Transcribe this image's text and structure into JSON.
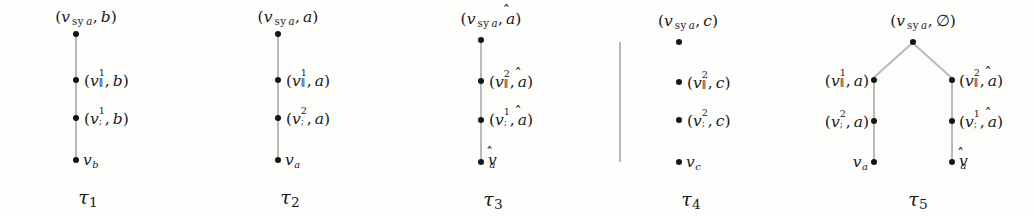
{
  "figure": {
    "type": "tree-diagram-set",
    "background": "#fdfdfc",
    "node_color": "#141414",
    "edge_color": "#b9b9b9",
    "symbols": {
      "v": "v",
      "sy_subscript": "sy",
      "sy_arg": "a",
      "parallel": "∥",
      "semicolon": ";",
      "hat": "̂",
      "emptyset": "∅",
      "tau": "τ",
      "open_paren": "(",
      "close_paren": ")",
      "comma": ","
    },
    "trees": [
      {
        "id": "tau-1",
        "caption": "τ",
        "caption_index": "1",
        "shape": "path",
        "nodes": [
          {
            "id": "t1-root",
            "label_side": "above",
            "v": "v",
            "sub": "sy a",
            "second": "b",
            "paren": true,
            "sup": "",
            "vsub": ""
          },
          {
            "id": "t1-n1",
            "label_side": "right",
            "v": "v",
            "sup": "1",
            "vsub": "∥",
            "second": "b",
            "paren": true
          },
          {
            "id": "t1-n2",
            "label_side": "right",
            "v": "v",
            "sup": "1",
            "vsub": ";",
            "second": "b",
            "paren": true
          },
          {
            "id": "t1-leaf",
            "label_side": "right",
            "v": "v",
            "vsub": "b",
            "leaf": true
          }
        ]
      },
      {
        "id": "tau-2",
        "caption": "τ",
        "caption_index": "2",
        "shape": "path",
        "nodes": [
          {
            "id": "t2-root",
            "label_side": "above",
            "v": "v",
            "sub": "sy a",
            "second": "a",
            "paren": true
          },
          {
            "id": "t2-n1",
            "label_side": "right",
            "v": "v",
            "sup": "1",
            "vsub": "∥",
            "second": "a",
            "paren": true
          },
          {
            "id": "t2-n2",
            "label_side": "right",
            "v": "v",
            "sup": "2",
            "vsub": ";",
            "second": "a",
            "paren": true
          },
          {
            "id": "t2-leaf",
            "label_side": "right",
            "v": "v",
            "vsub": "a",
            "leaf": true
          }
        ]
      },
      {
        "id": "tau-3",
        "caption": "τ",
        "caption_index": "3",
        "shape": "path",
        "nodes": [
          {
            "id": "t3-root",
            "label_side": "above",
            "v": "v",
            "sub": "sy a",
            "second": "â",
            "paren": true
          },
          {
            "id": "t3-n1",
            "label_side": "right",
            "v": "v",
            "sup": "2",
            "vsub": "∥",
            "second": "â",
            "paren": true
          },
          {
            "id": "t3-n2",
            "label_side": "right",
            "v": "v",
            "sup": "1",
            "vsub": ";",
            "second": "â",
            "paren": true
          },
          {
            "id": "t3-leaf",
            "label_side": "right",
            "v": "v̂",
            "vsub": "a",
            "leaf": true,
            "hatted": true
          }
        ]
      },
      {
        "id": "tau-4",
        "caption": "τ",
        "caption_index": "4",
        "shape": "path",
        "nodes": [
          {
            "id": "t4-root",
            "label_side": "above",
            "v": "v",
            "sub": "sy a",
            "second": "c",
            "paren": true
          },
          {
            "id": "t4-n1",
            "label_side": "right",
            "v": "v",
            "sup": "2",
            "vsub": "∥",
            "second": "c",
            "paren": true
          },
          {
            "id": "t4-n2",
            "label_side": "right",
            "v": "v",
            "sup": "2",
            "vsub": ";",
            "second": "c",
            "paren": true
          },
          {
            "id": "t4-leaf",
            "label_side": "right",
            "v": "v",
            "vsub": "c",
            "leaf": true
          }
        ]
      },
      {
        "id": "tau-5",
        "caption": "τ",
        "caption_index": "5",
        "shape": "branching",
        "nodes": [
          {
            "id": "t5-root",
            "label_side": "above",
            "v": "v",
            "sub": "sy a",
            "second": "∅",
            "paren": true
          },
          {
            "id": "t5-l1",
            "label_side": "left",
            "v": "v",
            "sup": "1",
            "vsub": "∥",
            "second": "a",
            "paren": true
          },
          {
            "id": "t5-l2",
            "label_side": "left",
            "v": "v",
            "sup": "2",
            "vsub": ";",
            "second": "a",
            "paren": true
          },
          {
            "id": "t5-lleaf",
            "label_side": "left",
            "v": "v",
            "vsub": "a",
            "leaf": true
          },
          {
            "id": "t5-r1",
            "label_side": "right",
            "v": "v",
            "sup": "2",
            "vsub": "∥",
            "second": "â",
            "paren": true
          },
          {
            "id": "t5-r2",
            "label_side": "right",
            "v": "v",
            "sup": "1",
            "vsub": ";",
            "second": "â",
            "paren": true
          },
          {
            "id": "t5-rleaf",
            "label_side": "right",
            "v": "v̂",
            "vsub": "a",
            "leaf": true,
            "hatted": true
          }
        ]
      }
    ],
    "labels": {
      "t1_root": "(v sy a, b)",
      "t1_n1": "(v∥¹, b)",
      "t1_n2": "(v;¹, b)",
      "t1_leaf": "v_b",
      "t2_root": "(v sy a, a)",
      "t2_n1": "(v∥¹, a)",
      "t2_n2": "(v;², a)",
      "t2_leaf": "v_a",
      "t3_root": "(v sy a, â)",
      "t3_n1": "(v∥², â)",
      "t3_n2": "(v;¹, â)",
      "t3_leaf": "v̂_a",
      "t4_root": "(v sy a, c)",
      "t4_n1": "(v∥², c)",
      "t4_n2": "(v;², c)",
      "t4_leaf": "v_c",
      "t5_root": "(v sy a, ∅)",
      "t5_l1": "(v∥¹, a)",
      "t5_l2": "(v;², a)",
      "t5_lleaf": "v_a",
      "t5_r1": "(v∥², â)",
      "t5_r2": "(v;¹, â)",
      "t5_rleaf": "v̂_a",
      "cap1": "τ1",
      "cap2": "τ2",
      "cap3": "τ3",
      "cap4": "τ4",
      "cap5": "τ5"
    }
  }
}
